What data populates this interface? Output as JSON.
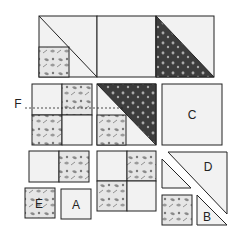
{
  "diagram": {
    "colors": {
      "background": "#ffffff",
      "plain_fabric": "#f2f2f2",
      "light_print_base": "#e6e6e6",
      "light_print_motif": "#8a8a8a",
      "dark_print_base": "#3d3d3d",
      "dark_print_motif": "#bdbdbd",
      "outline": "#222222"
    },
    "labels": {
      "A": "A",
      "B": "B",
      "C": "C",
      "D": "D",
      "E": "E",
      "F": "F"
    },
    "rows": [
      {
        "name": "top-row",
        "units": [
          {
            "id": "unit-1",
            "desc": "square with diagonal and small light-print square in lower-left"
          },
          {
            "id": "unit-2",
            "desc": "plain square"
          },
          {
            "id": "unit-3",
            "desc": "half-square triangle, dark print lower-left"
          }
        ]
      },
      {
        "name": "middle-row",
        "units": [
          {
            "id": "four-patch-F",
            "desc": "four-patch with dashed line F"
          },
          {
            "id": "unit-5",
            "desc": "dark print triangle upper-right with small light-print square lower-left"
          },
          {
            "id": "square-C",
            "desc": "plain square C"
          }
        ]
      },
      {
        "name": "bottom-row",
        "units": [
          {
            "id": "two-patch-strip",
            "desc": "plain + light print strip"
          },
          {
            "id": "square-E",
            "desc": "light print square E"
          },
          {
            "id": "square-A",
            "desc": "plain square A"
          },
          {
            "id": "four-patch",
            "desc": "four-patch plain/print"
          },
          {
            "id": "triangle-D",
            "desc": "large triangle D"
          },
          {
            "id": "small-triangle",
            "desc": "small plain triangle"
          },
          {
            "id": "print-square",
            "desc": "small light print square"
          },
          {
            "id": "triangle-B",
            "desc": "small triangle B"
          }
        ]
      }
    ]
  }
}
